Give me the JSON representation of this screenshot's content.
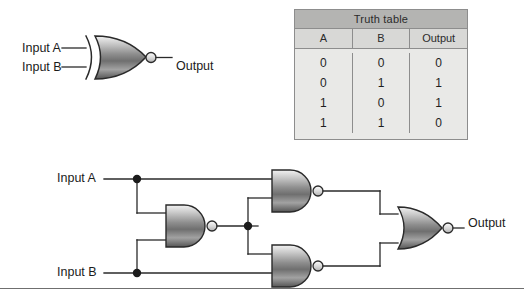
{
  "figure": {
    "kind": "logic-gate-diagram",
    "background_color": "#ffffff",
    "line_color": "#2a2a2a"
  },
  "top_symbol": {
    "gate_type": "XNOR",
    "gate_icon": "xnor-gate-icon",
    "bubble_icon": "inverting-bubble-icon",
    "input_a_label": "Input A",
    "input_b_label": "Input B",
    "output_label": "Output"
  },
  "truth_table": {
    "title": "Truth table",
    "columns": [
      "A",
      "B",
      "Output"
    ],
    "rows": [
      [
        "0",
        "0",
        "0"
      ],
      [
        "0",
        "1",
        "1"
      ],
      [
        "1",
        "0",
        "1"
      ],
      [
        "1",
        "1",
        "0"
      ]
    ],
    "header_fill": "#b4b4b2",
    "subheader_fill": "#d8d8d6",
    "body_fill": "#e9e9e7",
    "border_color": "#8d8d8d"
  },
  "circuit": {
    "input_a_label": "Input A",
    "input_b_label": "Input B",
    "output_label": "Output",
    "gates": [
      {
        "name": "nand-gate-center",
        "type": "NAND"
      },
      {
        "name": "nand-gate-top-right",
        "type": "NAND"
      },
      {
        "name": "nand-gate-bottom-right",
        "type": "NAND"
      },
      {
        "name": "nor-gate-output",
        "type": "NOR"
      }
    ],
    "junction_count": 3
  },
  "divider": {
    "name": "bottom-rule",
    "color": "#6f6f6f"
  }
}
